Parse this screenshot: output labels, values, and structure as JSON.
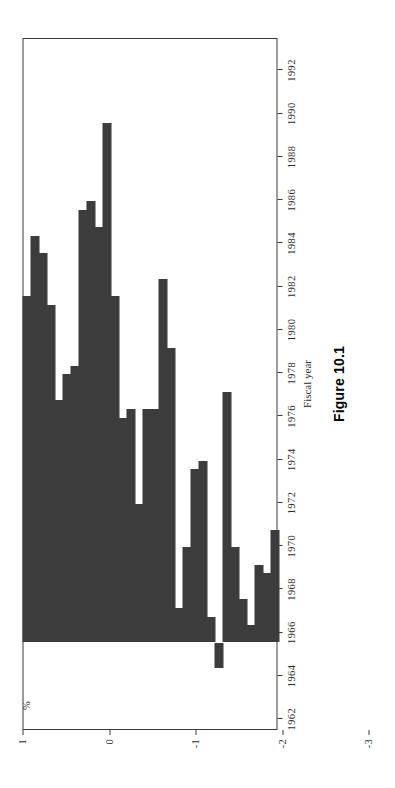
{
  "figure": {
    "caption": "Figure 10.1",
    "value_axis_title": "%",
    "category_axis_title": "Fiscal year"
  },
  "chart_data": {
    "type": "bar",
    "orientation": "vertical-bars-drawn-downward",
    "title": "Figure 10.1",
    "xlabel": "Fiscal year",
    "ylabel": "%",
    "grid": false,
    "legend": false,
    "ylim": [
      1,
      -7
    ],
    "y_ticks": [
      1,
      0,
      -1,
      -2,
      -3,
      -4,
      -5,
      -6,
      -7
    ],
    "y_tick_labels": [
      "1",
      "0",
      "-1",
      "-2",
      "-3",
      "-4",
      "-5",
      "-6",
      "-7"
    ],
    "x_tick_labels": [
      "1962",
      "1964",
      "1966",
      "1968",
      "1970",
      "1972",
      "1974",
      "1976",
      "1978",
      "1980",
      "1982",
      "1984",
      "1986",
      "1988",
      "1990",
      "1992"
    ],
    "categories": [
      "1962",
      "1963",
      "1964",
      "1965",
      "1966",
      "1967",
      "1968",
      "1969",
      "1970",
      "1971",
      "1972",
      "1973",
      "1974",
      "1975",
      "1976",
      "1977",
      "1978",
      "1979",
      "1980",
      "1981",
      "1982",
      "1983",
      "1984",
      "1985",
      "1986",
      "1987",
      "1988",
      "1989",
      "1990",
      "1991",
      "1992",
      "1993"
    ],
    "values": [
      -1.3,
      -0.8,
      -0.9,
      -0.2,
      -0.5,
      -1.1,
      -2.9,
      0.3,
      -0.3,
      -2.1,
      -2.0,
      -1.1,
      -0.4,
      -3.4,
      -4.2,
      -2.7,
      -2.7,
      -1.6,
      -2.7,
      -2.6,
      -4.0,
      -6.0,
      -4.8,
      -5.1,
      -5.0,
      -3.2,
      -3.1,
      -2.8,
      -3.9,
      -4.5,
      -4.7,
      -4.0
    ],
    "series": [
      {
        "name": "Federal deficit as % of GDP",
        "values": [
          -1.3,
          -0.8,
          -0.9,
          -0.2,
          -0.5,
          -1.1,
          -2.9,
          0.3,
          -0.3,
          -2.1,
          -2.0,
          -1.1,
          -0.4,
          -3.4,
          -4.2,
          -2.7,
          -2.7,
          -1.6,
          -2.7,
          -2.6,
          -4.0,
          -6.0,
          -4.8,
          -5.1,
          -5.0,
          -3.2,
          -3.1,
          -2.8,
          -3.9,
          -4.5,
          -4.7,
          -4.0
        ]
      }
    ],
    "bar_color": "#3c3c3c",
    "axis_color": "#3a3a3a"
  }
}
